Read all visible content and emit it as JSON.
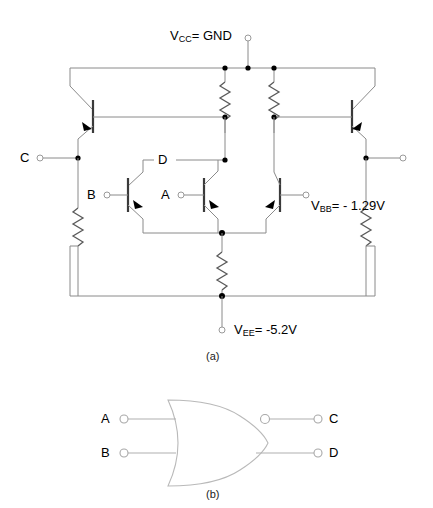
{
  "figure": {
    "captions": {
      "a": "(a)",
      "b": "(b)"
    }
  },
  "schematic": {
    "supplies": [
      {
        "id": "vcc",
        "main": "V",
        "sub": "CC",
        "tail": "= GND",
        "value": "GND"
      },
      {
        "id": "vbb",
        "main": "V",
        "sub": "BB",
        "tail": "= - 1.29V",
        "value": "-1.29V"
      },
      {
        "id": "vee",
        "main": "V",
        "sub": "EE",
        "tail": "= -5.2V",
        "value": "-5.2V"
      }
    ],
    "labels": {
      "input_a": "A",
      "input_b": "B",
      "output_c": "C",
      "node_d": "D"
    },
    "colors": {
      "wire": "#8a8a8a",
      "device": "#3a3a3a",
      "node": "#000000",
      "terminal_fill": "#ffffff"
    }
  },
  "logic_symbol": {
    "gate_type": "OR/NOR",
    "inputs": [
      {
        "label": "A"
      },
      {
        "label": "B"
      }
    ],
    "outputs": [
      {
        "label": "C",
        "inverted": true
      },
      {
        "label": "D",
        "inverted": false
      }
    ]
  }
}
